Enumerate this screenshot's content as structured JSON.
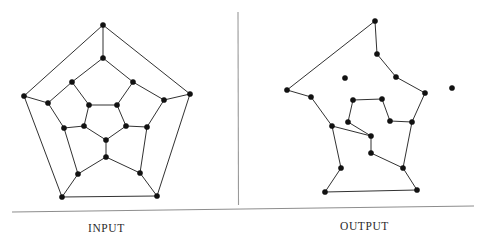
{
  "figure": {
    "title": "",
    "background_color": "#ffffff",
    "edge_color": "#1a1a1a",
    "vertex_color": "#111111",
    "rule_color": "#8d8d8d",
    "width": 482,
    "height": 248
  },
  "captions": {
    "input_label": "INPUT",
    "output_label": "OUTPUT"
  },
  "separators": {
    "vertical_divider": {
      "x1": 238,
      "y1": 12,
      "x2": 238.5,
      "y2": 205
    },
    "horizontal_rule": {
      "x1": 12,
      "y1": 212,
      "x2": 474,
      "y2": 206
    }
  },
  "chart_data": {
    "type": "diagram",
    "subtype": "graph-drawing",
    "panels": [
      {
        "name": "input",
        "label": "INPUT",
        "vertex_count": 20,
        "edge_count": 30,
        "vertices": [
          {
            "id": 0,
            "x": 103,
            "y": 25
          },
          {
            "id": 1,
            "x": 24,
            "y": 96
          },
          {
            "id": 2,
            "x": 62,
            "y": 197
          },
          {
            "id": 3,
            "x": 157,
            "y": 196
          },
          {
            "id": 4,
            "x": 190,
            "y": 94
          },
          {
            "id": 5,
            "x": 103,
            "y": 58
          },
          {
            "id": 6,
            "x": 48,
            "y": 103
          },
          {
            "id": 7,
            "x": 78,
            "y": 174
          },
          {
            "id": 8,
            "x": 140,
            "y": 173
          },
          {
            "id": 9,
            "x": 164,
            "y": 100
          },
          {
            "id": 10,
            "x": 72,
            "y": 82
          },
          {
            "id": 11,
            "x": 64,
            "y": 128
          },
          {
            "id": 12,
            "x": 106,
            "y": 157
          },
          {
            "id": 13,
            "x": 147,
            "y": 127
          },
          {
            "id": 14,
            "x": 133,
            "y": 82
          },
          {
            "id": 15,
            "x": 89,
            "y": 105
          },
          {
            "id": 16,
            "x": 84,
            "y": 126
          },
          {
            "id": 17,
            "x": 106,
            "y": 140
          },
          {
            "id": 18,
            "x": 126,
            "y": 126
          },
          {
            "id": 19,
            "x": 117,
            "y": 105
          }
        ],
        "edges": [
          [
            0,
            1
          ],
          [
            1,
            2
          ],
          [
            2,
            3
          ],
          [
            3,
            4
          ],
          [
            4,
            0
          ],
          [
            0,
            5
          ],
          [
            1,
            6
          ],
          [
            2,
            7
          ],
          [
            3,
            8
          ],
          [
            4,
            9
          ],
          [
            5,
            10
          ],
          [
            5,
            14
          ],
          [
            6,
            10
          ],
          [
            6,
            11
          ],
          [
            7,
            11
          ],
          [
            7,
            12
          ],
          [
            8,
            12
          ],
          [
            8,
            13
          ],
          [
            9,
            13
          ],
          [
            9,
            14
          ],
          [
            10,
            15
          ],
          [
            11,
            16
          ],
          [
            12,
            17
          ],
          [
            13,
            18
          ],
          [
            14,
            19
          ],
          [
            15,
            16
          ],
          [
            16,
            17
          ],
          [
            17,
            18
          ],
          [
            18,
            19
          ],
          [
            19,
            15
          ]
        ]
      },
      {
        "name": "output",
        "label": "OUTPUT",
        "vertex_count": 20,
        "edge_count": 20,
        "cycle_closed": true,
        "vertices": [
          {
            "id": 0,
            "x": 375,
            "y": 21
          },
          {
            "id": 1,
            "x": 287,
            "y": 90
          },
          {
            "id": 2,
            "x": 325,
            "y": 192
          },
          {
            "id": 3,
            "x": 417,
            "y": 190
          },
          {
            "id": 4,
            "x": 452,
            "y": 88
          },
          {
            "id": 5,
            "x": 377,
            "y": 54
          },
          {
            "id": 6,
            "x": 311,
            "y": 97
          },
          {
            "id": 7,
            "x": 341,
            "y": 168
          },
          {
            "id": 8,
            "x": 403,
            "y": 168
          },
          {
            "id": 9,
            "x": 425,
            "y": 93
          },
          {
            "id": 10,
            "x": 345,
            "y": 78
          },
          {
            "id": 11,
            "x": 332,
            "y": 126
          },
          {
            "id": 12,
            "x": 371,
            "y": 153
          },
          {
            "id": 13,
            "x": 412,
            "y": 122
          },
          {
            "id": 14,
            "x": 396,
            "y": 77
          },
          {
            "id": 15,
            "x": 353,
            "y": 100
          },
          {
            "id": 16,
            "x": 348,
            "y": 122
          },
          {
            "id": 17,
            "x": 371,
            "y": 136
          },
          {
            "id": 18,
            "x": 390,
            "y": 121
          },
          {
            "id": 19,
            "x": 382,
            "y": 99
          }
        ],
        "cycle_order": [
          0,
          1,
          6,
          10,
          15,
          19,
          18,
          13,
          9,
          14,
          5,
          0
        ],
        "edges": [
          [
            0,
            5
          ],
          [
            5,
            14
          ],
          [
            14,
            9
          ],
          [
            9,
            13
          ],
          [
            13,
            18
          ],
          [
            18,
            19
          ],
          [
            19,
            15
          ],
          [
            15,
            16
          ],
          [
            16,
            17
          ],
          [
            17,
            12
          ],
          [
            12,
            8
          ],
          [
            8,
            3
          ],
          [
            3,
            2
          ],
          [
            2,
            7
          ],
          [
            7,
            11
          ],
          [
            11,
            6
          ],
          [
            6,
            1
          ],
          [
            1,
            0
          ],
          [
            13,
            8
          ],
          [
            17,
            11
          ]
        ]
      }
    ]
  }
}
